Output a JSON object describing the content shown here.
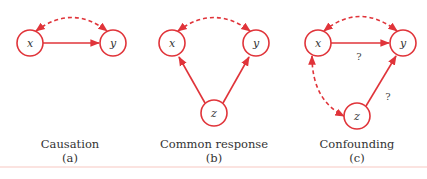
{
  "colors": {
    "accent": "#e0343a",
    "text": "#333333",
    "background": "#ffffff"
  },
  "panels": [
    {
      "id": "a",
      "caption": "Causation",
      "sublabel": "(a)",
      "nodes": [
        {
          "label": "x"
        },
        {
          "label": "y"
        }
      ],
      "edges": [
        {
          "from": "x",
          "to": "y",
          "style": "solid",
          "label": ""
        },
        {
          "from": "x",
          "to": "y",
          "style": "dashed-bidirectional",
          "label": ""
        }
      ]
    },
    {
      "id": "b",
      "caption": "Common response",
      "sublabel": "(b)",
      "nodes": [
        {
          "label": "x"
        },
        {
          "label": "y"
        },
        {
          "label": "z"
        }
      ],
      "edges": [
        {
          "from": "z",
          "to": "x",
          "style": "solid",
          "label": ""
        },
        {
          "from": "z",
          "to": "y",
          "style": "solid",
          "label": ""
        },
        {
          "from": "x",
          "to": "y",
          "style": "dashed-bidirectional",
          "label": ""
        }
      ]
    },
    {
      "id": "c",
      "caption": "Confounding",
      "sublabel": "(c)",
      "nodes": [
        {
          "label": "x"
        },
        {
          "label": "y"
        },
        {
          "label": "z"
        }
      ],
      "edges": [
        {
          "from": "x",
          "to": "y",
          "style": "solid",
          "label": "?"
        },
        {
          "from": "z",
          "to": "y",
          "style": "solid",
          "label": "?"
        },
        {
          "from": "x",
          "to": "y",
          "style": "dashed-bidirectional",
          "label": ""
        },
        {
          "from": "x",
          "to": "z",
          "style": "dashed-bidirectional",
          "label": ""
        }
      ]
    }
  ]
}
